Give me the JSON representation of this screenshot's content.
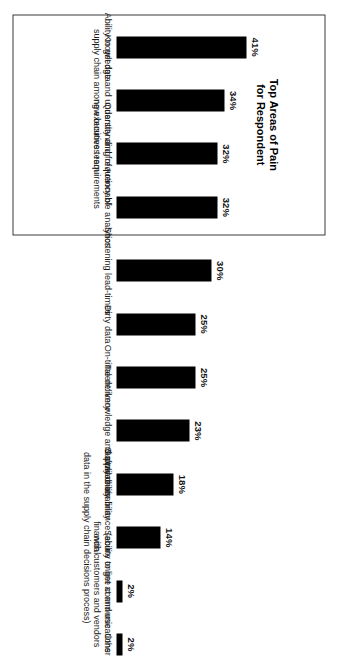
{
  "figure": {
    "title": "Top Areas of Pain\nfor Respondent",
    "background_color": "#ffffff",
    "bar_color": "#000000",
    "box_border_color": "#3a3a3a"
  },
  "chart_data": {
    "type": "bar",
    "title": "Top Areas of Pain for Respondent",
    "xlabel": "",
    "ylabel": "",
    "ylim": [
      0,
      45
    ],
    "grid": false,
    "legend": "none",
    "orientation": "vertical-bars-on-rotated-page",
    "value_suffix": "%",
    "categories": [
      "Ability to get data",
      "Knowledge and understanding of\nsupply chain among executive team",
      "Quantity and frequency of\nnew business requirements",
      "Actionable analytics",
      "Shortening lead-times",
      "Dirty data",
      "On-time delivery",
      "Talent: knowledge and availability",
      "Software usability",
      "Supply chain finance (ability to get at and use financial\ndata in the supply chain decisions process)",
      "Secure online communications\nwith customers and vendors",
      "Other"
    ],
    "values": [
      41,
      34,
      32,
      32,
      30,
      25,
      25,
      23,
      18,
      14,
      2,
      2
    ],
    "value_labels": [
      "41%",
      "34%",
      "32%",
      "32%",
      "30%",
      "25%",
      "25%",
      "23%",
      "18%",
      "14%",
      "2%",
      "2%"
    ],
    "highlight_group": {
      "label": "Top Areas of Pain for Respondent",
      "category_indices": [
        0,
        1,
        2,
        3
      ]
    }
  }
}
